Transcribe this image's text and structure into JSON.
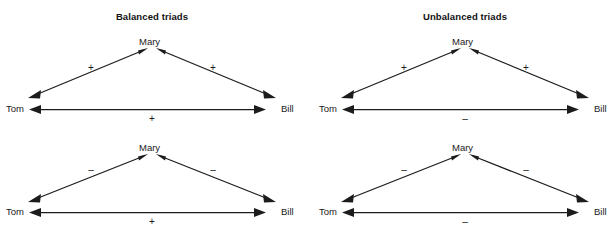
{
  "figure": {
    "background_color": "#ffffff",
    "line_color": "#1c1c1c",
    "text_color": "#1a1a1a",
    "panels": [
      {
        "id": "balanced",
        "title": "Balanced triads",
        "triads": [
          {
            "id": "balanced-top",
            "apex_label": "Mary",
            "left_label": "Tom",
            "right_label": "Bill",
            "sign_apex_left": "+",
            "sign_apex_right": "+",
            "sign_base": "+"
          },
          {
            "id": "balanced-bottom",
            "apex_label": "Mary",
            "left_label": "Tom",
            "right_label": "Bill",
            "sign_apex_left": "–",
            "sign_apex_right": "–",
            "sign_base": "+"
          }
        ]
      },
      {
        "id": "unbalanced",
        "title": "Unbalanced triads",
        "triads": [
          {
            "id": "unbalanced-top",
            "apex_label": "Mary",
            "left_label": "Tom",
            "right_label": "Bill",
            "sign_apex_left": "+",
            "sign_apex_right": "+",
            "sign_base": "–"
          },
          {
            "id": "unbalanced-bottom",
            "apex_label": "Mary",
            "left_label": "Tom",
            "right_label": "Bill",
            "sign_apex_left": "–",
            "sign_apex_right": "–",
            "sign_base": "–"
          }
        ]
      }
    ]
  }
}
